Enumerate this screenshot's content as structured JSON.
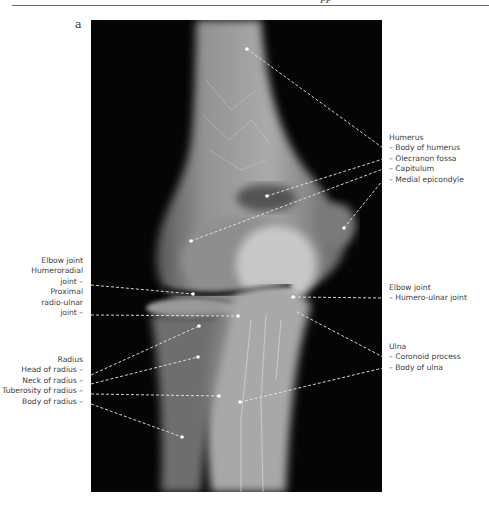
{
  "header": {
    "fragment": "pp"
  },
  "panel": {
    "label": "a"
  },
  "labels": {
    "humerus": {
      "title": "Humerus",
      "items": [
        "– Body of humerus",
        "– Olecranon fossa",
        "– Capitulum",
        "– Medial epicondyle"
      ]
    },
    "elbow_left": {
      "title": "Elbow joint",
      "items": [
        "Humeroradial",
        "joint –",
        "Proximal",
        "radio-ulnar",
        "joint –"
      ]
    },
    "elbow_right": {
      "title": "Elbow joint",
      "items": [
        "– Humero-ulnar joint"
      ]
    },
    "radius": {
      "title": "Radius",
      "items": [
        "Head of radius –",
        "Neck of radius –",
        "Tuberosity of radius –",
        "Body of radius –"
      ]
    },
    "ulna": {
      "title": "Ulna",
      "items": [
        "– Coronoid process",
        "– Body of ulna"
      ]
    }
  },
  "colors": {
    "xray_bg": "#050505",
    "leader": "#e6e6e6",
    "text": "#3d3d3d"
  }
}
